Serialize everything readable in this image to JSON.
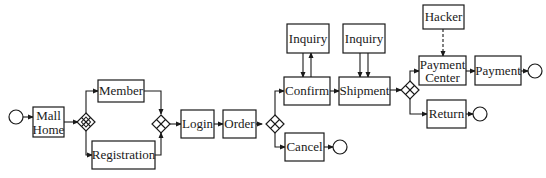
{
  "diagram": {
    "type": "process-flow",
    "nodes": {
      "start": {
        "type": "start-event"
      },
      "mall_home": {
        "label_line1": "Mall",
        "label_line2": "Home"
      },
      "gateway_1": {
        "type": "gateway"
      },
      "member": {
        "label": "Member"
      },
      "registration": {
        "label": "Registration"
      },
      "gateway_2": {
        "type": "gateway"
      },
      "login": {
        "label": "Login"
      },
      "order": {
        "label": "Order"
      },
      "gateway_3": {
        "type": "gateway"
      },
      "inquiry_1": {
        "label": "Inquiry"
      },
      "confirm": {
        "label": "Confirm"
      },
      "inquiry_2": {
        "label": "Inquiry"
      },
      "shipment": {
        "label": "Shipment"
      },
      "cancel": {
        "label": "Cancel"
      },
      "end_cancel": {
        "type": "end-event"
      },
      "gateway_4": {
        "type": "gateway"
      },
      "hacker": {
        "label": "Hacker"
      },
      "payment_center": {
        "label_line1": "Payment",
        "label_line2": "Center"
      },
      "payment": {
        "label": "Payment"
      },
      "end_payment": {
        "type": "end-event"
      },
      "return": {
        "label": "Return"
      },
      "end_return": {
        "type": "end-event"
      }
    },
    "edges": [
      {
        "from": "start",
        "to": "mall_home"
      },
      {
        "from": "mall_home",
        "to": "gateway_1"
      },
      {
        "from": "gateway_1",
        "to": "member"
      },
      {
        "from": "gateway_1",
        "to": "registration"
      },
      {
        "from": "member",
        "to": "gateway_2"
      },
      {
        "from": "registration",
        "to": "gateway_2"
      },
      {
        "from": "gateway_2",
        "to": "login"
      },
      {
        "from": "login",
        "to": "order"
      },
      {
        "from": "order",
        "to": "gateway_3"
      },
      {
        "from": "gateway_3",
        "to": "confirm"
      },
      {
        "from": "gateway_3",
        "to": "cancel"
      },
      {
        "from": "cancel",
        "to": "end_cancel"
      },
      {
        "from": "inquiry_1",
        "to": "confirm"
      },
      {
        "from": "confirm",
        "to": "inquiry_1"
      },
      {
        "from": "inquiry_2",
        "to": "shipment"
      },
      {
        "from": "inquiry_2",
        "to": "shipment"
      },
      {
        "from": "confirm",
        "to": "shipment"
      },
      {
        "from": "shipment",
        "to": "gateway_4"
      },
      {
        "from": "gateway_4",
        "to": "payment_center"
      },
      {
        "from": "gateway_4",
        "to": "return"
      },
      {
        "from": "hacker",
        "to": "payment_center",
        "style": "dashed"
      },
      {
        "from": "payment_center",
        "to": "payment"
      },
      {
        "from": "payment",
        "to": "end_payment"
      },
      {
        "from": "return",
        "to": "end_return"
      }
    ]
  }
}
